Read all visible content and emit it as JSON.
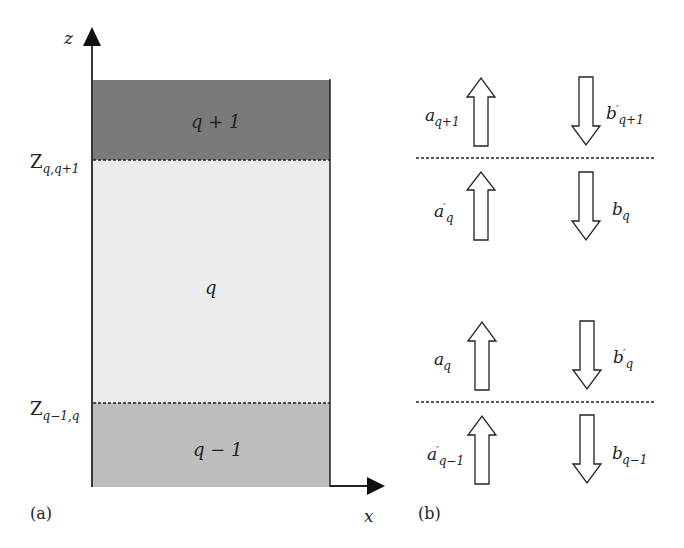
{
  "panel_a": {
    "caption": "(a)",
    "axis": {
      "z_label": "z",
      "x_label": "x"
    },
    "layers": [
      {
        "label": "q + 1",
        "color": "#7a7a7a"
      },
      {
        "label": "q",
        "color": "#ececec"
      },
      {
        "label": "q − 1",
        "color": "#bdbdbd"
      }
    ],
    "interfaces": [
      {
        "symbol": "Z",
        "subscript": "q,q+1"
      },
      {
        "symbol": "Z",
        "subscript": "q−1,q"
      }
    ]
  },
  "panel_b": {
    "caption": "(b)",
    "upper_interface": {
      "above_up": {
        "symbol": "a",
        "sub": "q+1",
        "prime": ""
      },
      "above_down": {
        "symbol": "b",
        "sub": "q+1",
        "prime": "′"
      },
      "below_up": {
        "symbol": "a",
        "sub": "q",
        "prime": "′"
      },
      "below_down": {
        "symbol": "b",
        "sub": "q",
        "prime": ""
      }
    },
    "lower_interface": {
      "above_up": {
        "symbol": "a",
        "sub": "q",
        "prime": ""
      },
      "above_down": {
        "symbol": "b",
        "sub": "q",
        "prime": "′"
      },
      "below_up": {
        "symbol": "a",
        "sub": "q−1",
        "prime": "′"
      },
      "below_down": {
        "symbol": "b",
        "sub": "q−1",
        "prime": ""
      }
    }
  }
}
